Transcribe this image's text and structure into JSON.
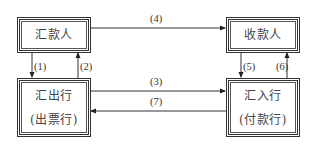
{
  "nodes": {
    "remitter": {
      "label": "汇款人"
    },
    "payee": {
      "label": "收款人"
    },
    "remitting_bank": {
      "label": "汇出行",
      "sublabel": "(出票行)"
    },
    "paying_bank": {
      "label": "汇入行",
      "sublabel": "(付款行)"
    }
  },
  "edges": [
    {
      "id": "1",
      "label": "(1)",
      "from": "remitter",
      "to": "remitting_bank"
    },
    {
      "id": "2",
      "label": "(2)",
      "from": "remitting_bank",
      "to": "remitter"
    },
    {
      "id": "3",
      "label": "(3)",
      "from": "remitting_bank",
      "to": "paying_bank"
    },
    {
      "id": "4",
      "label": "(4)",
      "from": "remitter",
      "to": "payee"
    },
    {
      "id": "5",
      "label": "(5)",
      "from": "payee",
      "to": "paying_bank"
    },
    {
      "id": "6",
      "label": "(6)",
      "from": "paying_bank",
      "to": "payee"
    },
    {
      "id": "7",
      "label": "(7)",
      "from": "paying_bank",
      "to": "remitting_bank"
    }
  ]
}
